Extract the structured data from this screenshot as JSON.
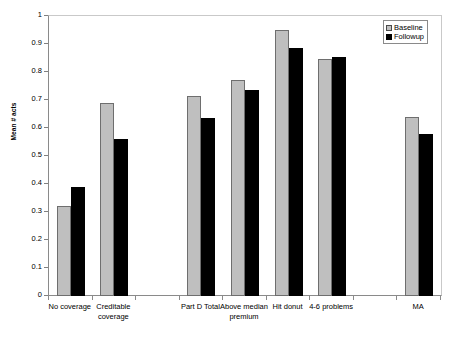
{
  "chart_data": {
    "type": "bar",
    "title": "",
    "xlabel": "",
    "ylabel": "Mean # acts",
    "ylim": [
      0,
      1
    ],
    "ytick_values": [
      0,
      0.1,
      0.2,
      0.3,
      0.4,
      0.5,
      0.6,
      0.7,
      0.8,
      0.9,
      1
    ],
    "ytick_labels": [
      "0",
      "0.1",
      "0.2",
      "0.3",
      "0.4",
      "0.5",
      "0.6",
      "0.7",
      "0.8",
      "0.9",
      "1"
    ],
    "grid": false,
    "legend_position": "top-right",
    "categories": [
      "No coverage",
      "Creditable coverage",
      "",
      "Part D Total",
      "Above median premium",
      "Hit donut",
      "4-6 problems",
      "",
      "MA"
    ],
    "series": [
      {
        "name": "Baseline",
        "color": "#bfbfbf",
        "values": [
          0.32,
          0.69,
          null,
          0.715,
          0.77,
          0.95,
          0.845,
          null,
          0.64
        ]
      },
      {
        "name": "Followup",
        "color": "#000000",
        "values": [
          0.39,
          0.56,
          null,
          0.635,
          0.735,
          0.885,
          0.855,
          null,
          0.58
        ]
      }
    ]
  },
  "legend": {
    "items": [
      {
        "label": "Baseline",
        "swatch": "baseline"
      },
      {
        "label": "Followup",
        "swatch": "followup"
      }
    ]
  }
}
